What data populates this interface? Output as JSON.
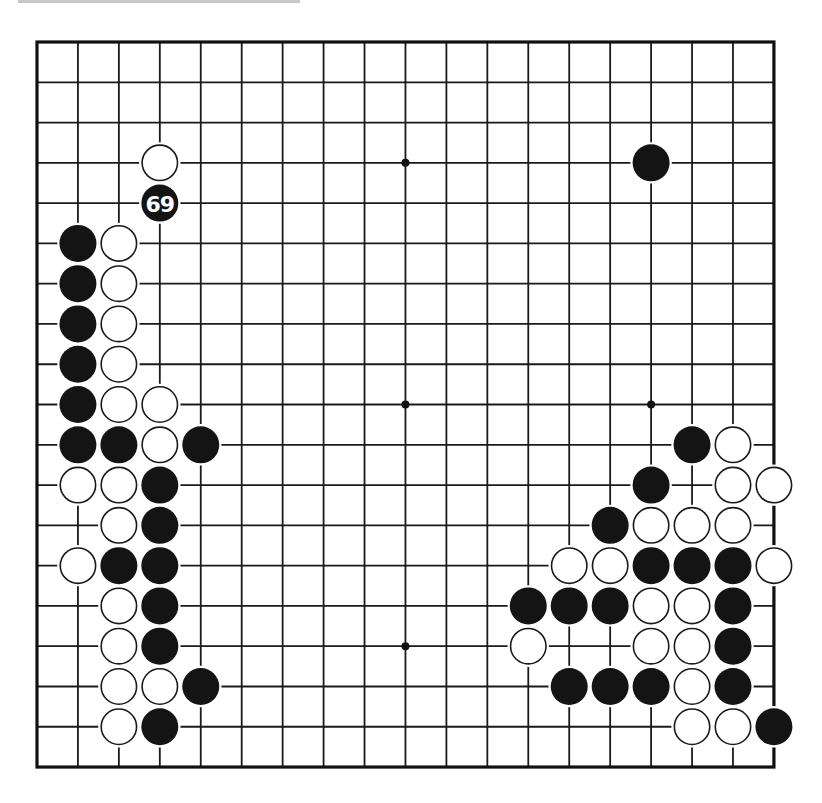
{
  "board": {
    "size": 19,
    "origin_x": 37,
    "origin_y": 42,
    "spacing_x": 40.94,
    "spacing_y": 40.28,
    "stone_radius": 18.5,
    "line_color": "#1a1a1a",
    "black_color": "#141414",
    "white_color": "#ffffff",
    "hoshi": [
      [
        3,
        3
      ],
      [
        9,
        3
      ],
      [
        15,
        3
      ],
      [
        3,
        9
      ],
      [
        9,
        9
      ],
      [
        15,
        9
      ],
      [
        3,
        15
      ],
      [
        9,
        15
      ],
      [
        15,
        15
      ]
    ]
  },
  "last_move": {
    "color": "black",
    "col": 3,
    "row": 4,
    "label": "69"
  },
  "stones": {
    "black": [
      [
        15,
        3
      ],
      [
        3,
        4
      ],
      [
        1,
        5
      ],
      [
        1,
        6
      ],
      [
        1,
        7
      ],
      [
        1,
        8
      ],
      [
        1,
        9
      ],
      [
        1,
        10
      ],
      [
        2,
        10
      ],
      [
        4,
        10
      ],
      [
        3,
        11
      ],
      [
        3,
        12
      ],
      [
        2,
        13
      ],
      [
        3,
        13
      ],
      [
        3,
        14
      ],
      [
        3,
        15
      ],
      [
        4,
        16
      ],
      [
        3,
        17
      ],
      [
        16,
        10
      ],
      [
        15,
        11
      ],
      [
        14,
        12
      ],
      [
        15,
        13
      ],
      [
        16,
        13
      ],
      [
        17,
        13
      ],
      [
        12,
        14
      ],
      [
        13,
        14
      ],
      [
        14,
        14
      ],
      [
        17,
        14
      ],
      [
        17,
        15
      ],
      [
        13,
        16
      ],
      [
        14,
        16
      ],
      [
        15,
        16
      ],
      [
        17,
        16
      ],
      [
        18,
        17
      ]
    ],
    "white": [
      [
        3,
        3
      ],
      [
        2,
        5
      ],
      [
        2,
        6
      ],
      [
        2,
        7
      ],
      [
        2,
        8
      ],
      [
        2,
        9
      ],
      [
        3,
        9
      ],
      [
        3,
        10
      ],
      [
        1,
        11
      ],
      [
        2,
        11
      ],
      [
        2,
        12
      ],
      [
        1,
        13
      ],
      [
        2,
        14
      ],
      [
        2,
        15
      ],
      [
        2,
        16
      ],
      [
        3,
        16
      ],
      [
        2,
        17
      ],
      [
        17,
        10
      ],
      [
        17,
        11
      ],
      [
        18,
        11
      ],
      [
        15,
        12
      ],
      [
        16,
        12
      ],
      [
        17,
        12
      ],
      [
        13,
        13
      ],
      [
        14,
        13
      ],
      [
        18,
        13
      ],
      [
        15,
        14
      ],
      [
        16,
        14
      ],
      [
        12,
        15
      ],
      [
        15,
        15
      ],
      [
        16,
        15
      ],
      [
        16,
        16
      ],
      [
        16,
        17
      ],
      [
        17,
        17
      ]
    ]
  },
  "labels": [
    {
      "col": 3,
      "row": 4,
      "text": "69",
      "on": "black"
    }
  ]
}
